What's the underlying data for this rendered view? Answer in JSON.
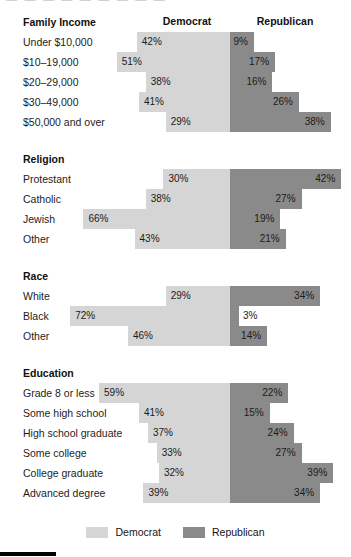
{
  "top_partial_text": "—   —   —   —   —   —   —   —   —",
  "headers": {
    "democrat": "Democrat",
    "republican": "Republican"
  },
  "legend": {
    "democrat": "Democrat",
    "republican": "Republican"
  },
  "colors": {
    "democrat": "#d5d5d5",
    "republican": "#8a8a8a",
    "text": "#1a1a1a",
    "background": "#ffffff"
  },
  "chart_data": {
    "type": "bar",
    "title": "",
    "subtype": "diverging-stacked-bar",
    "xlabel": "",
    "ylabel": "",
    "legend": [
      "Democrat",
      "Republican"
    ],
    "legend_position": "bottom-center",
    "grid": false,
    "value_suffix": "%",
    "series": [
      {
        "name": "Democrat",
        "color": "#d5d5d5"
      },
      {
        "name": "Republican",
        "color": "#8a8a8a"
      }
    ],
    "sections": [
      {
        "title": "Family Income",
        "rows": [
          {
            "label": "Under $10,000",
            "democrat": 42,
            "republican": 9,
            "democrat_text": "42%",
            "republican_text": "9%"
          },
          {
            "label": "$10–19,000",
            "democrat": 51,
            "republican": 17,
            "democrat_text": "51%",
            "republican_text": "17%"
          },
          {
            "label": "$20–29,000",
            "democrat": 38,
            "republican": 16,
            "democrat_text": "38%",
            "republican_text": "16%"
          },
          {
            "label": "$30–49,000",
            "democrat": 41,
            "republican": 26,
            "democrat_text": "41%",
            "republican_text": "26%"
          },
          {
            "label": "$50,000 and over",
            "democrat": 29,
            "republican": 38,
            "democrat_text": "29%",
            "republican_text": "38%"
          }
        ]
      },
      {
        "title": "Religion",
        "rows": [
          {
            "label": "Protestant",
            "democrat": 30,
            "republican": 42,
            "democrat_text": "30%",
            "republican_text": "42%"
          },
          {
            "label": "Catholic",
            "democrat": 38,
            "republican": 27,
            "democrat_text": "38%",
            "republican_text": "27%"
          },
          {
            "label": "Jewish",
            "democrat": 66,
            "republican": 19,
            "democrat_text": "66%",
            "republican_text": "19%"
          },
          {
            "label": "Other",
            "democrat": 43,
            "republican": 21,
            "democrat_text": "43%",
            "republican_text": "21%"
          }
        ]
      },
      {
        "title": "Race",
        "rows": [
          {
            "label": "White",
            "democrat": 29,
            "republican": 34,
            "democrat_text": "29%",
            "republican_text": "34%"
          },
          {
            "label": "Black",
            "democrat": 72,
            "republican": 3,
            "democrat_text": "72%",
            "republican_text": "3%",
            "republican_label_outside": true
          },
          {
            "label": "Other",
            "democrat": 46,
            "republican": 14,
            "democrat_text": "46%",
            "republican_text": "14%"
          }
        ]
      },
      {
        "title": "Education",
        "rows": [
          {
            "label": "Grade 8 or less",
            "democrat": 59,
            "republican": 22,
            "democrat_text": "59%",
            "republican_text": "22%"
          },
          {
            "label": "Some high school",
            "democrat": 41,
            "republican": 15,
            "democrat_text": "41%",
            "republican_text": "15%"
          },
          {
            "label": "High school graduate",
            "democrat": 37,
            "republican": 24,
            "democrat_text": "37%",
            "republican_text": "24%"
          },
          {
            "label": "Some college",
            "democrat": 33,
            "republican": 27,
            "democrat_text": "33%",
            "republican_text": "27%"
          },
          {
            "label": "College graduate",
            "democrat": 32,
            "republican": 39,
            "democrat_text": "32%",
            "republican_text": "39%"
          },
          {
            "label": "Advanced degree",
            "democrat": 39,
            "republican": 34,
            "democrat_text": "39%",
            "republican_text": "34%"
          }
        ]
      }
    ]
  }
}
